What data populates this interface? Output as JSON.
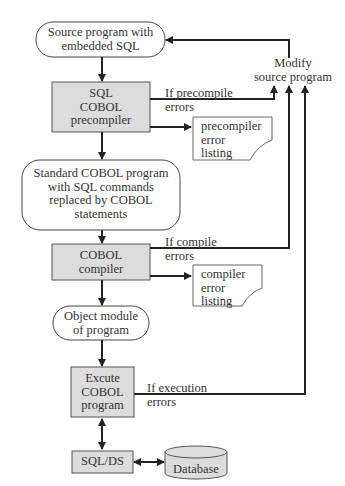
{
  "nodes": {
    "source": {
      "line1": "Source program with",
      "line2": "embedded SQL"
    },
    "precompiler": {
      "line1": "SQL",
      "line2": "COBOL",
      "line3": "precompiler"
    },
    "standard": {
      "line1": "Standard COBOL program",
      "line2": "with SQL commands",
      "line3": "replaced by COBOL",
      "line4": "statements"
    },
    "compiler": {
      "line1": "COBOL",
      "line2": "compiler"
    },
    "object": {
      "line1": "Object module",
      "line2": "of program"
    },
    "execute": {
      "line1": "Excute",
      "line2": "COBOL",
      "line3": "program"
    },
    "sqlds": {
      "label": "SQL/DS"
    },
    "database": {
      "label": "Database"
    },
    "precompile_listing": {
      "line1": "precompiler",
      "line2": "error",
      "line3": "listing"
    },
    "compile_listing": {
      "line1": "compiler",
      "line2": "error",
      "line3": "listing"
    },
    "modify": {
      "line1": "Modify",
      "line2": "source program"
    }
  },
  "edges": {
    "precompile_errors": {
      "line1": "If precompile",
      "line2": "errors"
    },
    "compile_errors": {
      "line1": "If compile",
      "line2": "errors"
    },
    "execution_errors": {
      "line1": "If execution",
      "line2": "errors"
    }
  },
  "colors": {
    "box_fill": "#dcdcdc",
    "stroke": "#222222",
    "text": "#333333",
    "background": "#ffffff"
  }
}
